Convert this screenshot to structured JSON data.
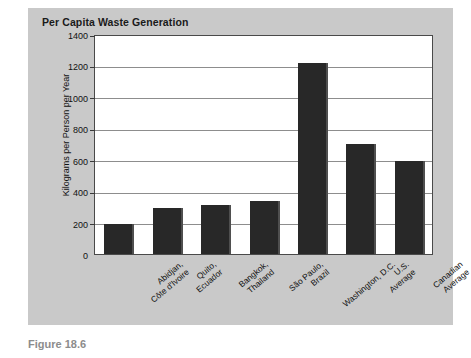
{
  "chart_data": {
    "type": "bar",
    "title": "Per Capita Waste Generation",
    "xlabel": "",
    "ylabel": "Kilograms per Person per Year",
    "ylim": [
      0,
      1400
    ],
    "ytick_step": 200,
    "yticks": [
      1400,
      1200,
      1000,
      800,
      600,
      400,
      200,
      0
    ],
    "grid": true,
    "legend": false,
    "bar_color": "#282828",
    "plot_background": "#ffffff",
    "panel_background": "#c9c9c9",
    "categories": [
      "Abidjan,\nCôte d'Ivoire",
      "Quito,\nEcuador",
      "Bangkok,\nThailand",
      "São Paulo,\nBrazil",
      "Washington, D.C.",
      "U.S.\nAverage",
      "Canadian\nAverage"
    ],
    "category_lines": [
      [
        "Abidjan,",
        "Côte d'Ivoire"
      ],
      [
        "Quito,",
        "Ecuador"
      ],
      [
        "Bangkok,",
        "Thailand"
      ],
      [
        "São Paulo,",
        "Brazil"
      ],
      [
        "Washington, D.C."
      ],
      [
        "U.S.",
        "Average"
      ],
      [
        "Canadian",
        "Average"
      ]
    ],
    "values": [
      190,
      290,
      315,
      335,
      1215,
      700,
      590
    ]
  },
  "caption": {
    "text": "Figure 18.6"
  }
}
